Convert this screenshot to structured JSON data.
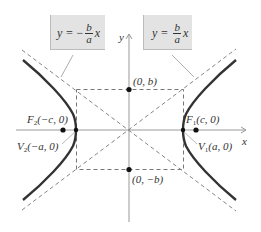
{
  "diagram": {
    "axes": {
      "x_label": "x",
      "y_label": "y"
    },
    "asymptotes": [
      {
        "id": "neg",
        "lhs": "y",
        "sign": "−",
        "num": "b",
        "den": "a",
        "var": "x"
      },
      {
        "id": "pos",
        "lhs": "y",
        "sign": "",
        "num": "b",
        "den": "a",
        "var": "x"
      }
    ],
    "points": {
      "top": "(0, b)",
      "bottom": "(0, −b)",
      "f1": {
        "name": "F",
        "sub": "1",
        "coords": "(c, 0)"
      },
      "f2": {
        "name": "F",
        "sub": "2",
        "coords": "(−c, 0)"
      },
      "v1": {
        "name": "V",
        "sub": "1",
        "coords": "(a, 0)"
      },
      "v2": {
        "name": "V",
        "sub": "2",
        "coords": "(−a, 0)"
      }
    },
    "colors": {
      "curve": "#333333",
      "axis": "#888888",
      "dashed": "#777777",
      "box": "#e3e3e3"
    }
  }
}
